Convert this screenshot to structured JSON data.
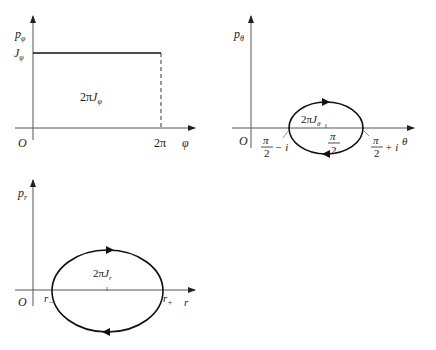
{
  "plots": {
    "phi": {
      "y_label": "p",
      "y_label_sub": "φ",
      "level_label": "J",
      "level_label_sub": "φ",
      "area_label_pre": "2π",
      "area_label": "J",
      "area_label_sub": "φ",
      "origin": "O",
      "x_tick": "2π",
      "x_label": "φ"
    },
    "theta": {
      "y_label": "p",
      "y_label_sub": "θ",
      "area_label_pre": "2π",
      "area_label": "J",
      "area_label_sub": "θ",
      "origin": "O",
      "x_label": "θ",
      "left_frac_num": "π",
      "left_frac_den": "2",
      "left_suffix": "− i",
      "mid_frac_num": "π",
      "mid_frac_den": "2",
      "right_frac_num": "π",
      "right_frac_den": "2",
      "right_suffix": "+ i"
    },
    "r": {
      "y_label": "p",
      "y_label_sub": "r",
      "area_label_pre": "2π",
      "area_label": "J",
      "area_label_sub": "r",
      "origin": "O",
      "x_label": "r",
      "left_tick": "r",
      "left_tick_sub": "−",
      "right_tick": "r",
      "right_tick_sub": "+"
    }
  },
  "colors": {
    "axis": "#555555",
    "curve": "#111111"
  }
}
